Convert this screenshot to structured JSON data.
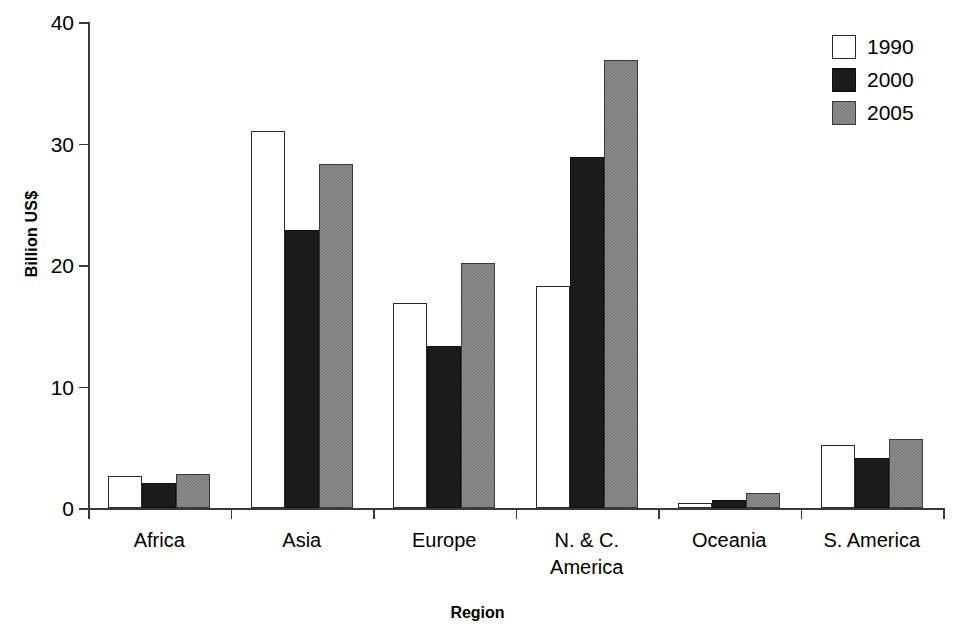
{
  "chart_data": {
    "type": "bar",
    "title": "",
    "xlabel": "Region",
    "ylabel": "Billion US$",
    "categories": [
      "Africa",
      "Asia",
      "Europe",
      "N. & C.\nAmerica",
      "Oceania",
      "S. America"
    ],
    "series": [
      {
        "name": "1990",
        "color": "#ffffff",
        "values": [
          2.6,
          31.0,
          16.9,
          18.3,
          0.4,
          5.2
        ]
      },
      {
        "name": "2000",
        "color": "#1b1b1b",
        "values": [
          2.1,
          22.9,
          13.3,
          28.9,
          0.7,
          4.1
        ]
      },
      {
        "name": "2005",
        "color": "#7e7e7e",
        "values": [
          2.8,
          28.3,
          20.2,
          36.9,
          1.2,
          5.7
        ]
      }
    ],
    "ylim": [
      0,
      40
    ],
    "yticks": [
      0,
      10,
      20,
      30,
      40
    ],
    "ytick_labels": [
      "0",
      "10",
      "20",
      "30",
      "40"
    ],
    "grid": false,
    "legend_position": "top-right",
    "legend_entries": [
      "1990",
      "2000",
      "2005"
    ],
    "axis_color": "#3a3a3a"
  }
}
